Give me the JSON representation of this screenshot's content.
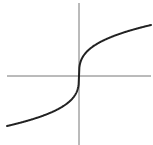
{
  "chart_data": {
    "type": "line",
    "title": "",
    "xlabel": "",
    "ylabel": "",
    "function": "y = cbrt(x)",
    "grid": false,
    "legend": null,
    "xlim": [
      -1,
      1
    ],
    "ylim": [
      -1,
      1
    ],
    "series": [
      {
        "name": "f(x)",
        "x": [
          -1.0,
          -0.75,
          -0.5,
          -0.25,
          -0.1,
          -0.02,
          0,
          0.02,
          0.1,
          0.25,
          0.5,
          0.75,
          1.0
        ],
        "y": [
          -1.0,
          -0.909,
          -0.794,
          -0.63,
          -0.464,
          -0.271,
          0,
          0.271,
          0.464,
          0.63,
          0.794,
          0.909,
          1.0
        ],
        "color": "#222222"
      }
    ]
  },
  "style": {
    "axis_color": "#777777",
    "curve_color": "#222222"
  }
}
